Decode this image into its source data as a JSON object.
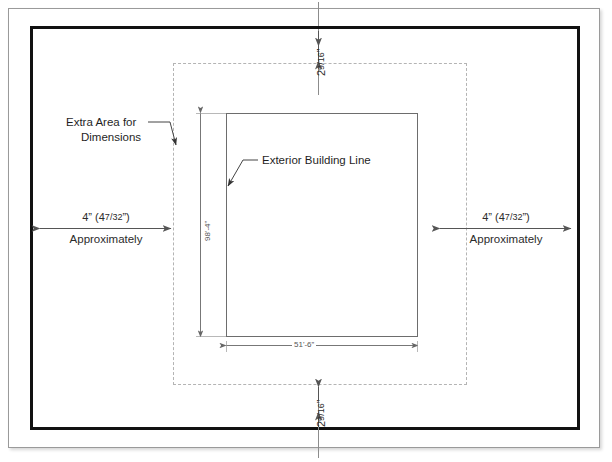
{
  "drawing": {
    "title": "Plan sheet layout with building outline and margin dimensions",
    "type": "architectural-plan-layout",
    "colors": {
      "outer_frame": "#9a9a9a",
      "inner_frame": "#111111",
      "dashed_rect": "#b4b4b4",
      "building_line": "#6d6d6d",
      "dimension_line": "#555555",
      "text": "#2b2b2b",
      "background": "#ffffff"
    }
  },
  "labels": {
    "extra_area": {
      "line1": "Extra Area for",
      "line2": "Dimensions"
    },
    "exterior_building_line": "Exterior Building Line"
  },
  "dimensions": {
    "top_margin": {
      "whole": "2",
      "numerator": "9",
      "denominator": "16",
      "unit": "”",
      "text": "2 9/16”"
    },
    "bottom_margin": {
      "whole": "2",
      "numerator": "9",
      "denominator": "16",
      "unit": "”",
      "text": "2 9/16”"
    },
    "left_margin": {
      "primary": "4”",
      "paren_whole": "4",
      "paren_numerator": "7",
      "paren_denominator": "32",
      "paren_unit": "”",
      "text": "4” (4 7/32”)",
      "note": "Approximately"
    },
    "right_margin": {
      "primary": "4”",
      "paren_whole": "4",
      "paren_numerator": "7",
      "paren_denominator": "32",
      "paren_unit": "”",
      "text": "4” (4 7/32”)",
      "note": "Approximately"
    },
    "building_height": "98'-4”",
    "building_width": "51'-6”"
  }
}
